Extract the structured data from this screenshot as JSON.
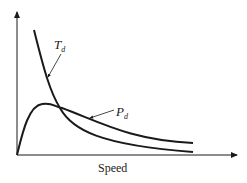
{
  "diagram": {
    "x_axis_label": "Speed",
    "y_axis_label": "",
    "curves": [
      {
        "name": "torque",
        "label_main": "T",
        "label_sub": "d",
        "description": "decreasing hyperbolic torque curve"
      },
      {
        "name": "power",
        "label_main": "P",
        "label_sub": "d",
        "description": "power curve rising to a peak then decaying"
      }
    ],
    "colors": {
      "line": "#1a1a1a",
      "background": "#ffffff"
    }
  }
}
